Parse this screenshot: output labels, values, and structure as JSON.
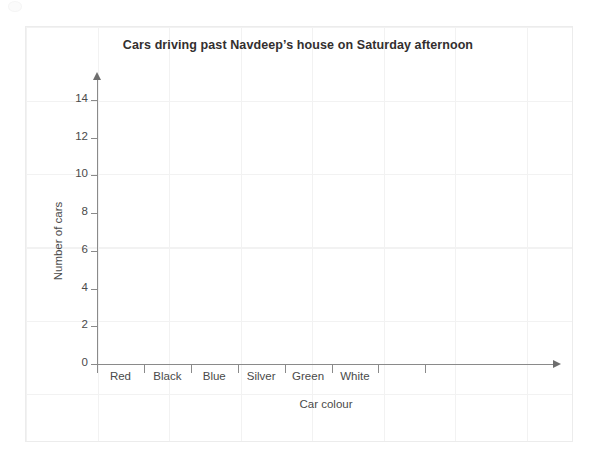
{
  "chart_data": {
    "type": "bar",
    "title": "Cars driving past Navdeep’s house on Saturday afternoon",
    "xlabel": "Car colour",
    "ylabel": "Number of cars",
    "categories": [
      "Red",
      "Black",
      "Blue",
      "Silver",
      "Green",
      "White"
    ],
    "values": [
      0,
      0,
      0,
      0,
      0,
      0
    ],
    "ytick_labels": [
      "0",
      "2",
      "4",
      "6",
      "8",
      "10",
      "12",
      "14"
    ],
    "ytick_values": [
      0,
      2,
      4,
      6,
      8,
      10,
      12,
      14
    ],
    "ylim": [
      0,
      15
    ],
    "grid": true,
    "legend": "none",
    "note": "Empty axes — no bars are plotted; blank bar chart template for pupils to complete."
  },
  "canvas": {
    "background_color": "#ffffff",
    "grid_color": "#f2f2f2",
    "border_color": "#ececec",
    "axis_color": "#8a8a8a",
    "text_color": "#4a4a4a",
    "title_color": "#332f2f"
  },
  "icons": {
    "y_axis_arrow": "arrow-up-icon",
    "x_axis_arrow": "arrow-right-icon"
  }
}
